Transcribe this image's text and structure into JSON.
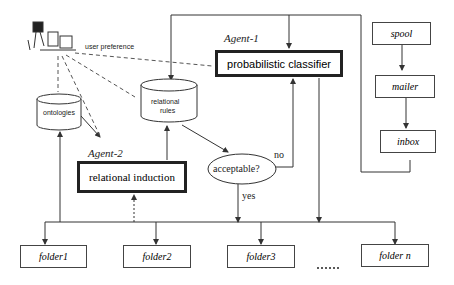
{
  "diagram": {
    "user": {
      "label": "user preference"
    },
    "agents": [
      {
        "name": "Agent-1",
        "component": "probabilistic classifier"
      },
      {
        "name": "Agent-2",
        "component": "relational induction"
      }
    ],
    "stores": [
      {
        "id": "ontologies",
        "label": "ontologies"
      },
      {
        "id": "rules",
        "label_line1": "relational",
        "label_line2": "rules"
      }
    ],
    "decision": {
      "label": "acceptable?",
      "no_label": "no",
      "yes_label": "yes"
    },
    "mail_pipeline": [
      {
        "label": "spool"
      },
      {
        "label": "mailer"
      },
      {
        "label": "inbox"
      }
    ],
    "folders": [
      {
        "label": "folder1"
      },
      {
        "label": "folder2"
      },
      {
        "label": "folder3"
      },
      {
        "label": "folder n"
      }
    ],
    "ellipsis": "......",
    "colors": {
      "line": "#333333",
      "background": "#ffffff"
    }
  }
}
